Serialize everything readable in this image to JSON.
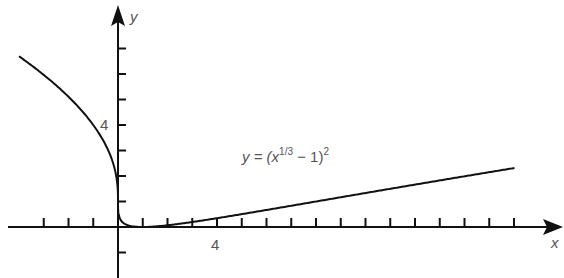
{
  "chart_data": {
    "type": "line",
    "title": "",
    "xlabel": "x",
    "ylabel": "y",
    "annotation": "y = (x^{1/3} − 1)^2",
    "function": "y = (x^(1/3) - 1)^2",
    "x_tick_labels": [
      {
        "value": 4,
        "label": "4"
      }
    ],
    "y_tick_labels": [
      {
        "value": 4,
        "label": "4"
      }
    ],
    "xlim": [
      -4.8,
      17.9
    ],
    "ylim": [
      -1.9,
      8.7
    ],
    "x_ticks": [
      -3,
      -2,
      -1,
      1,
      2,
      3,
      4,
      5,
      6,
      7,
      8,
      9,
      10,
      11,
      12,
      13,
      14,
      15,
      16
    ],
    "y_ticks": [
      -1,
      1,
      2,
      3,
      4,
      5,
      6,
      7
    ],
    "grid": false,
    "series": [
      {
        "name": "y = (x^(1/3) - 1)^2",
        "x": [
          -4,
          -3,
          -2,
          -1,
          -0.5,
          -0.1,
          0,
          0.05,
          0.2,
          0.5,
          1,
          2,
          3,
          4,
          6,
          8,
          10,
          12,
          16
        ],
        "y": [
          6.62,
          5.97,
          5.08,
          4.0,
          3.24,
          2.15,
          1.0,
          0.4,
          0.17,
          0.04,
          0.0,
          0.07,
          0.19,
          0.34,
          0.67,
          1.0,
          1.33,
          1.66,
          2.31
        ]
      }
    ]
  },
  "labels": {
    "x_axis": "x",
    "y_axis": "y",
    "x_four": "4",
    "y_four": "4",
    "eq_y": "y = (x",
    "eq_exp": "1/3",
    "eq_mid": " − 1)",
    "eq_sq": "2"
  },
  "colors": {
    "axis": "#111111",
    "curve": "#111111",
    "text": "#555555"
  }
}
